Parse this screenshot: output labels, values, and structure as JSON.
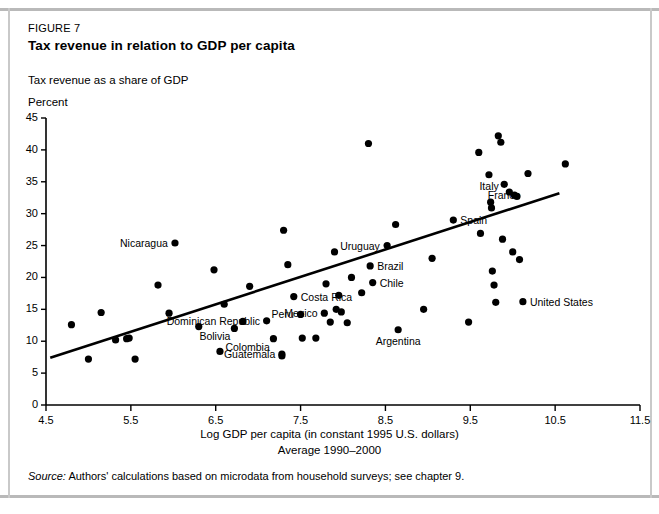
{
  "figure": {
    "number": "FIGURE 7",
    "title": "Tax revenue in relation to GDP per capita",
    "subtitle": "Tax revenue as a share of GDP",
    "unit": "Percent",
    "source_prefix": "Source:",
    "source_text": "Authors' calculations based on microdata from household surveys; see chapter 9."
  },
  "chart_data": {
    "type": "scatter",
    "title": "Tax revenue in relation to GDP per capita",
    "subtitle": "Tax revenue as a share of GDP",
    "xlabel": "Log GDP per capita (in constant 1995 U.S. dollars)",
    "xlabel2": "Average 1990–2000",
    "ylabel": "Percent",
    "xlim": [
      4.5,
      11.5
    ],
    "ylim": [
      0,
      45
    ],
    "xticks": [
      "4.5",
      "5.5",
      "6.5",
      "7.5",
      "8.5",
      "9.5",
      "10.5",
      "11.5"
    ],
    "xtick_values": [
      4.5,
      5.5,
      6.5,
      7.5,
      8.5,
      9.5,
      10.5,
      11.5
    ],
    "yticks": [
      "0",
      "5",
      "10",
      "15",
      "20",
      "25",
      "30",
      "35",
      "40",
      "45"
    ],
    "ytick_values": [
      0,
      5,
      10,
      15,
      20,
      25,
      30,
      35,
      40,
      45
    ],
    "grid": false,
    "legend": "none",
    "trendline": {
      "x0": 4.55,
      "y0": 7.4,
      "x1": 10.55,
      "y1": 33.2
    },
    "points": [
      {
        "x": 4.8,
        "y": 12.6,
        "label": ""
      },
      {
        "x": 5.0,
        "y": 7.2,
        "label": ""
      },
      {
        "x": 5.15,
        "y": 14.5,
        "label": ""
      },
      {
        "x": 5.32,
        "y": 10.2,
        "label": ""
      },
      {
        "x": 5.45,
        "y": 10.4,
        "label": ""
      },
      {
        "x": 5.48,
        "y": 10.5,
        "label": ""
      },
      {
        "x": 5.55,
        "y": 7.2,
        "label": ""
      },
      {
        "x": 5.82,
        "y": 18.8,
        "label": ""
      },
      {
        "x": 5.95,
        "y": 14.4,
        "label": ""
      },
      {
        "x": 6.02,
        "y": 25.4,
        "label": "Nicaragua",
        "label_pos": "left"
      },
      {
        "x": 6.3,
        "y": 12.3,
        "label": ""
      },
      {
        "x": 6.48,
        "y": 21.2,
        "label": ""
      },
      {
        "x": 6.55,
        "y": 8.4,
        "label": ""
      },
      {
        "x": 6.6,
        "y": 15.8,
        "label": ""
      },
      {
        "x": 6.72,
        "y": 12.0,
        "label": "Bolivia",
        "label_pos": "below-left"
      },
      {
        "x": 6.82,
        "y": 13.1,
        "label": ""
      },
      {
        "x": 6.9,
        "y": 18.6,
        "label": ""
      },
      {
        "x": 7.1,
        "y": 13.2,
        "label": "Dominican Republic",
        "label_pos": "left"
      },
      {
        "x": 7.18,
        "y": 10.4,
        "label": "Colombia",
        "label_pos": "below-left"
      },
      {
        "x": 7.28,
        "y": 8.0,
        "label": "Guatemala",
        "label_pos": "left"
      },
      {
        "x": 7.28,
        "y": 7.7,
        "label": ""
      },
      {
        "x": 7.3,
        "y": 27.4,
        "label": ""
      },
      {
        "x": 7.35,
        "y": 22.0,
        "label": ""
      },
      {
        "x": 7.42,
        "y": 17.0,
        "label": "Costa Rica",
        "label_pos": "right"
      },
      {
        "x": 7.5,
        "y": 14.2,
        "label": "Peru",
        "label_pos": "left"
      },
      {
        "x": 7.52,
        "y": 10.5,
        "label": ""
      },
      {
        "x": 7.68,
        "y": 10.5,
        "label": ""
      },
      {
        "x": 7.78,
        "y": 14.4,
        "label": "Mexico",
        "label_pos": "left"
      },
      {
        "x": 7.8,
        "y": 19.0,
        "label": ""
      },
      {
        "x": 7.85,
        "y": 13.0,
        "label": ""
      },
      {
        "x": 7.9,
        "y": 24.0,
        "label": ""
      },
      {
        "x": 7.92,
        "y": 15.0,
        "label": ""
      },
      {
        "x": 7.95,
        "y": 17.2,
        "label": ""
      },
      {
        "x": 7.98,
        "y": 14.6,
        "label": ""
      },
      {
        "x": 8.05,
        "y": 12.9,
        "label": ""
      },
      {
        "x": 8.1,
        "y": 20.0,
        "label": ""
      },
      {
        "x": 8.22,
        "y": 17.6,
        "label": ""
      },
      {
        "x": 8.3,
        "y": 41.0,
        "label": ""
      },
      {
        "x": 8.32,
        "y": 21.8,
        "label": "Brazil",
        "label_pos": "right"
      },
      {
        "x": 8.35,
        "y": 19.2,
        "label": "Chile",
        "label_pos": "right"
      },
      {
        "x": 8.52,
        "y": 25.0,
        "label": "Uruguay",
        "label_pos": "left"
      },
      {
        "x": 8.62,
        "y": 28.3,
        "label": ""
      },
      {
        "x": 8.65,
        "y": 11.8,
        "label": "Argentina",
        "label_pos": "below"
      },
      {
        "x": 8.95,
        "y": 15.0,
        "label": ""
      },
      {
        "x": 9.05,
        "y": 23.0,
        "label": ""
      },
      {
        "x": 9.3,
        "y": 29.0,
        "label": "Spain",
        "label_pos": "right"
      },
      {
        "x": 9.48,
        "y": 13.0,
        "label": ""
      },
      {
        "x": 9.6,
        "y": 39.6,
        "label": ""
      },
      {
        "x": 9.62,
        "y": 26.9,
        "label": ""
      },
      {
        "x": 9.72,
        "y": 36.1,
        "label": "Italy",
        "label_pos": "below"
      },
      {
        "x": 9.74,
        "y": 31.8,
        "label": ""
      },
      {
        "x": 9.75,
        "y": 30.9,
        "label": ""
      },
      {
        "x": 9.76,
        "y": 21.0,
        "label": ""
      },
      {
        "x": 9.78,
        "y": 18.8,
        "label": ""
      },
      {
        "x": 9.8,
        "y": 16.1,
        "label": ""
      },
      {
        "x": 9.83,
        "y": 42.2,
        "label": ""
      },
      {
        "x": 9.86,
        "y": 41.2,
        "label": ""
      },
      {
        "x": 9.88,
        "y": 26.0,
        "label": ""
      },
      {
        "x": 9.9,
        "y": 34.6,
        "label": "France",
        "label_pos": "below"
      },
      {
        "x": 9.96,
        "y": 33.4,
        "label": ""
      },
      {
        "x": 10.0,
        "y": 24.0,
        "label": ""
      },
      {
        "x": 10.02,
        "y": 32.9,
        "label": ""
      },
      {
        "x": 10.05,
        "y": 32.7,
        "label": ""
      },
      {
        "x": 10.08,
        "y": 22.8,
        "label": ""
      },
      {
        "x": 10.12,
        "y": 16.2,
        "label": "United States",
        "label_pos": "right"
      },
      {
        "x": 10.18,
        "y": 36.3,
        "label": ""
      },
      {
        "x": 10.62,
        "y": 37.8,
        "label": ""
      }
    ]
  }
}
